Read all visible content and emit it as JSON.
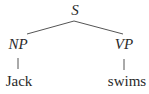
{
  "tree": {
    "root": {
      "label": "S"
    },
    "children": [
      {
        "label": "NP",
        "leaf": "Jack"
      },
      {
        "label": "VP",
        "leaf": "swims"
      }
    ]
  },
  "colors": {
    "line": "#555555",
    "text": "#2a2a2a"
  }
}
